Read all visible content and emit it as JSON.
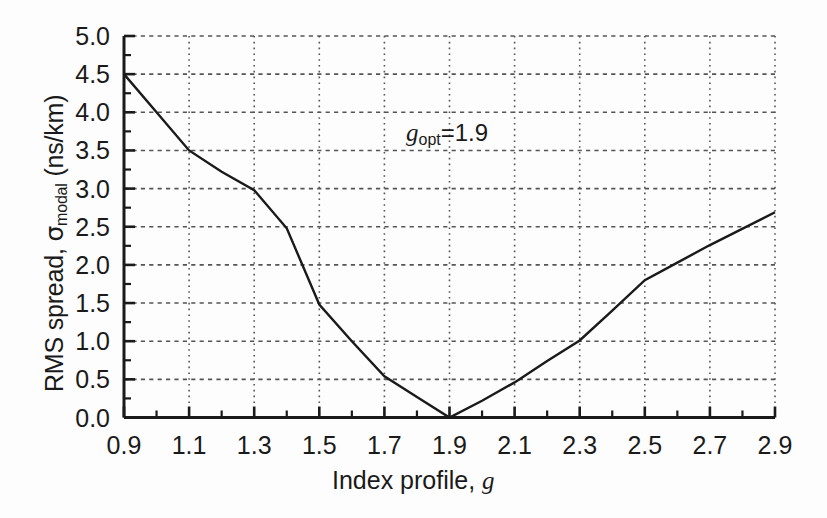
{
  "figure": {
    "background_color": "#fdfdfd",
    "axis_color": "#1a1a1a",
    "grid_color": "#555555",
    "curve_color": "#1a1a1a"
  },
  "annotation": {
    "symbol": "g",
    "subscript": "opt",
    "equals_value": "=1.9"
  },
  "axis_labels": {
    "y_prefix": "RMS spread, ",
    "y_sigma": "σ",
    "y_sub": "modal",
    "y_suffix": "  (ns/km)",
    "x_prefix": "Index profile, ",
    "x_symbol": "g"
  },
  "chart_data": {
    "type": "line",
    "title": "",
    "xlabel": "Index profile, g",
    "ylabel": "RMS spread, σmodal (ns/km)",
    "xlim": [
      0.9,
      2.9
    ],
    "ylim": [
      0.0,
      5.0
    ],
    "grid": true,
    "grid_style": "dotted",
    "legend": "none",
    "xticks": [
      0.9,
      1.1,
      1.3,
      1.5,
      1.7,
      1.9,
      2.1,
      2.3,
      2.5,
      2.7,
      2.9
    ],
    "xtick_labels": [
      "0.9",
      "1.1",
      "1.3",
      "1.5",
      "1.7",
      "1.9",
      "2.1",
      "2.3",
      "2.5",
      "2.7",
      "2.9"
    ],
    "xminor_interval": 0.1,
    "yticks": [
      0.0,
      0.5,
      1.0,
      1.5,
      2.0,
      2.5,
      3.0,
      3.5,
      4.0,
      4.5,
      5.0
    ],
    "ytick_labels": [
      "0.0",
      "0.5",
      "1.0",
      "1.5",
      "2.0",
      "2.5",
      "3.0",
      "3.5",
      "4.0",
      "4.5",
      "5.0"
    ],
    "yminor_interval": 0.25,
    "annotations": [
      {
        "text": "g_opt=1.9",
        "x": 1.86,
        "y": 3.72
      }
    ],
    "series": [
      {
        "name": "modal RMS spread",
        "x": [
          0.9,
          1.0,
          1.1,
          1.2,
          1.3,
          1.4,
          1.5,
          1.6,
          1.7,
          1.8,
          1.9,
          2.0,
          2.1,
          2.2,
          2.3,
          2.4,
          2.5,
          2.6,
          2.7,
          2.9
        ],
        "y": [
          4.5,
          4.0,
          3.5,
          3.22,
          2.98,
          2.48,
          1.48,
          1.0,
          0.54,
          0.27,
          0.0,
          0.22,
          0.46,
          0.74,
          1.01,
          1.4,
          1.8,
          2.03,
          2.26,
          2.69
        ]
      }
    ]
  }
}
